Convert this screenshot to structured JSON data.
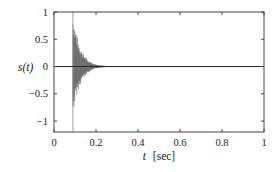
{
  "chart_data": {
    "type": "line",
    "title": "",
    "xlabel_var": "t",
    "xlabel_unit": "[sec]",
    "ylabel": "s(t)",
    "xlim": [
      0,
      1
    ],
    "ylim": [
      -1.2,
      1
    ],
    "xticks": [
      0,
      0.2,
      0.4,
      0.6,
      0.8,
      1
    ],
    "xtick_labels": [
      "0",
      "0.2",
      "0.4",
      "0.6",
      "0.8",
      "1"
    ],
    "yticks": [
      1,
      0.5,
      0,
      -0.5,
      -1
    ],
    "ytick_labels": [
      "1",
      "0.5",
      "0",
      "−0.5",
      "−1"
    ],
    "grid": false,
    "legend": null,
    "series": [
      {
        "name": "s(t)",
        "description": "Decaying oscillatory signal (impulse-like), onset at t≈0.09 s, peak amplitude ≈1, decays to ≈0 by t≈0.25 s; near zero afterwards",
        "onset": 0.09,
        "peak_positive": 1.0,
        "peak_negative": -0.9,
        "decay_end": 0.25,
        "spike_line": {
          "t": 0.09,
          "from": -1.2,
          "to": 1.0
        },
        "color": "#555555"
      }
    ],
    "zero_line": 0
  },
  "plot": {
    "box": {
      "left": 54,
      "top": 12,
      "right": 264,
      "bottom": 132
    },
    "colors": {
      "axis": "#444444",
      "signal": "#555555",
      "zero": "#222222"
    }
  }
}
